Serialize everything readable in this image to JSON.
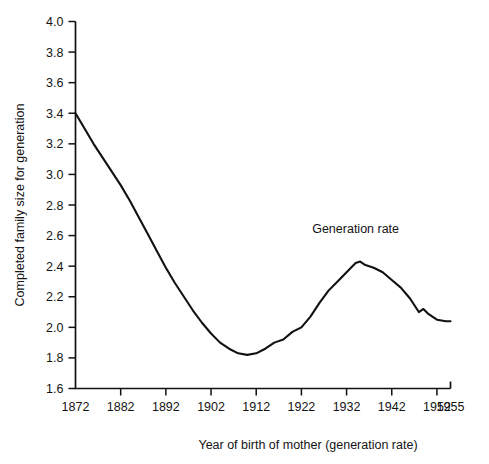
{
  "chart_data": {
    "type": "line",
    "title": "",
    "xlabel": "Year of birth of mother (generation rate)",
    "ylabel": "Completed family size for generation",
    "xlim": [
      1872,
      1955
    ],
    "ylim": [
      1.6,
      4.0
    ],
    "grid": false,
    "legend_position": "none",
    "xticks": [
      1872,
      1882,
      1892,
      1902,
      1912,
      1922,
      1932,
      1942,
      1952,
      1955
    ],
    "xtick_labels": [
      "1872",
      "1882",
      "1892",
      "1902",
      "1912",
      "1922",
      "1932",
      "1942",
      "1952",
      "1955"
    ],
    "yticks": [
      1.6,
      1.8,
      2.0,
      2.2,
      2.4,
      2.6,
      2.8,
      3.0,
      3.2,
      3.4,
      3.6,
      3.8,
      4.0
    ],
    "ytick_labels": [
      "1.6",
      "1.8",
      "2.0",
      "2.2",
      "2.4",
      "2.6",
      "2.8",
      "3.0",
      "3.2",
      "3.4",
      "3.6",
      "3.8",
      "4.0"
    ],
    "annotations": [
      {
        "text": "Generation rate",
        "x": 1934,
        "y": 2.62
      }
    ],
    "series": [
      {
        "name": "Generation rate",
        "color": "#111111",
        "x": [
          1872,
          1874,
          1876,
          1878,
          1880,
          1882,
          1884,
          1886,
          1888,
          1890,
          1892,
          1894,
          1896,
          1898,
          1900,
          1902,
          1904,
          1906,
          1908,
          1910,
          1912,
          1914,
          1916,
          1918,
          1920,
          1922,
          1924,
          1926,
          1928,
          1930,
          1932,
          1934,
          1935,
          1936,
          1938,
          1940,
          1942,
          1944,
          1946,
          1948,
          1949,
          1950,
          1952,
          1954,
          1955
        ],
        "y": [
          3.4,
          3.3,
          3.2,
          3.11,
          3.02,
          2.93,
          2.83,
          2.72,
          2.61,
          2.5,
          2.39,
          2.29,
          2.2,
          2.11,
          2.03,
          1.96,
          1.9,
          1.86,
          1.83,
          1.82,
          1.83,
          1.86,
          1.9,
          1.92,
          1.97,
          2.0,
          2.07,
          2.16,
          2.24,
          2.3,
          2.36,
          2.42,
          2.43,
          2.41,
          2.39,
          2.36,
          2.31,
          2.26,
          2.19,
          2.1,
          2.12,
          2.09,
          2.05,
          2.04,
          2.04
        ]
      }
    ]
  }
}
